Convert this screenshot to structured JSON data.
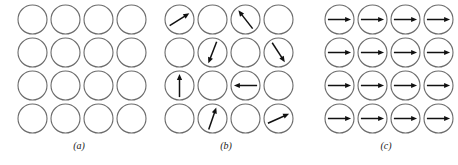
{
  "figure": {
    "background_color": "#ffffff",
    "circle_stroke_color": "#6b6b6b",
    "arrow_color": "#111111",
    "grid_rows": 4,
    "grid_cols": 4,
    "circle_diameter_px": 29,
    "circle_spacing_px": 33
  },
  "panels": [
    {
      "id": "panel-a",
      "caption": "(a)",
      "description": "Four-by-four grid of empty circles; no spin arrows, unmagnetized state",
      "arrow_count": 0,
      "arrows": [
        {
          "row": 1,
          "col": 1,
          "angle_deg": null
        },
        {
          "row": 1,
          "col": 2,
          "angle_deg": null
        },
        {
          "row": 1,
          "col": 3,
          "angle_deg": null
        },
        {
          "row": 1,
          "col": 4,
          "angle_deg": null
        },
        {
          "row": 2,
          "col": 1,
          "angle_deg": null
        },
        {
          "row": 2,
          "col": 2,
          "angle_deg": null
        },
        {
          "row": 2,
          "col": 3,
          "angle_deg": null
        },
        {
          "row": 2,
          "col": 4,
          "angle_deg": null
        },
        {
          "row": 3,
          "col": 1,
          "angle_deg": null
        },
        {
          "row": 3,
          "col": 2,
          "angle_deg": null
        },
        {
          "row": 3,
          "col": 3,
          "angle_deg": null
        },
        {
          "row": 3,
          "col": 4,
          "angle_deg": null
        },
        {
          "row": 4,
          "col": 1,
          "angle_deg": null
        },
        {
          "row": 4,
          "col": 2,
          "angle_deg": null
        },
        {
          "row": 4,
          "col": 3,
          "angle_deg": null
        },
        {
          "row": 4,
          "col": 4,
          "angle_deg": null
        }
      ]
    },
    {
      "id": "panel-b",
      "caption": "(b)",
      "description": "Four-by-four grid of circles with six randomly oriented spin arrows; remaining circles empty",
      "arrow_count": 8,
      "arrows": [
        {
          "row": 1,
          "col": 1,
          "angle_deg": 32
        },
        {
          "row": 1,
          "col": 2,
          "angle_deg": null
        },
        {
          "row": 1,
          "col": 3,
          "angle_deg": 128
        },
        {
          "row": 1,
          "col": 4,
          "angle_deg": null
        },
        {
          "row": 2,
          "col": 1,
          "angle_deg": null
        },
        {
          "row": 2,
          "col": 2,
          "angle_deg": 249
        },
        {
          "row": 2,
          "col": 3,
          "angle_deg": null
        },
        {
          "row": 2,
          "col": 4,
          "angle_deg": 303
        },
        {
          "row": 3,
          "col": 1,
          "angle_deg": 90
        },
        {
          "row": 3,
          "col": 2,
          "angle_deg": null
        },
        {
          "row": 3,
          "col": 3,
          "angle_deg": 180
        },
        {
          "row": 3,
          "col": 4,
          "angle_deg": null
        },
        {
          "row": 4,
          "col": 1,
          "angle_deg": null
        },
        {
          "row": 4,
          "col": 2,
          "angle_deg": 71
        },
        {
          "row": 4,
          "col": 3,
          "angle_deg": null
        },
        {
          "row": 4,
          "col": 4,
          "angle_deg": 24
        }
      ]
    },
    {
      "id": "panel-c",
      "caption": "(c)",
      "description": "Four-by-four grid of circles with all sixteen spin arrows aligned pointing right; fully magnetized state",
      "arrow_count": 16,
      "arrows": [
        {
          "row": 1,
          "col": 1,
          "angle_deg": 0
        },
        {
          "row": 1,
          "col": 2,
          "angle_deg": 0
        },
        {
          "row": 1,
          "col": 3,
          "angle_deg": 0
        },
        {
          "row": 1,
          "col": 4,
          "angle_deg": 0
        },
        {
          "row": 2,
          "col": 1,
          "angle_deg": 0
        },
        {
          "row": 2,
          "col": 2,
          "angle_deg": 0
        },
        {
          "row": 2,
          "col": 3,
          "angle_deg": 0
        },
        {
          "row": 2,
          "col": 4,
          "angle_deg": 0
        },
        {
          "row": 3,
          "col": 1,
          "angle_deg": 0
        },
        {
          "row": 3,
          "col": 2,
          "angle_deg": 0
        },
        {
          "row": 3,
          "col": 3,
          "angle_deg": 0
        },
        {
          "row": 3,
          "col": 4,
          "angle_deg": 0
        },
        {
          "row": 4,
          "col": 1,
          "angle_deg": 0
        },
        {
          "row": 4,
          "col": 2,
          "angle_deg": 0
        },
        {
          "row": 4,
          "col": 3,
          "angle_deg": 0
        },
        {
          "row": 4,
          "col": 4,
          "angle_deg": 0
        }
      ]
    }
  ]
}
